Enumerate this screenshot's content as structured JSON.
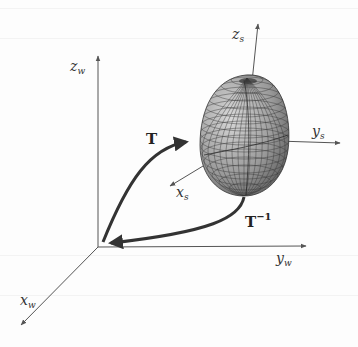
{
  "diagram": {
    "world_frame": {
      "x_label": "x",
      "x_sub": "w",
      "y_label": "y",
      "y_sub": "w",
      "z_label": "z",
      "z_sub": "w"
    },
    "shape_frame": {
      "x_label": "x",
      "x_sub": "s",
      "y_label": "y",
      "y_sub": "s",
      "z_label": "z",
      "z_sub": "s"
    },
    "transforms": {
      "forward": "T",
      "inverse": "T",
      "inverse_sup": "−1"
    },
    "object": "superquadric-mesh"
  }
}
